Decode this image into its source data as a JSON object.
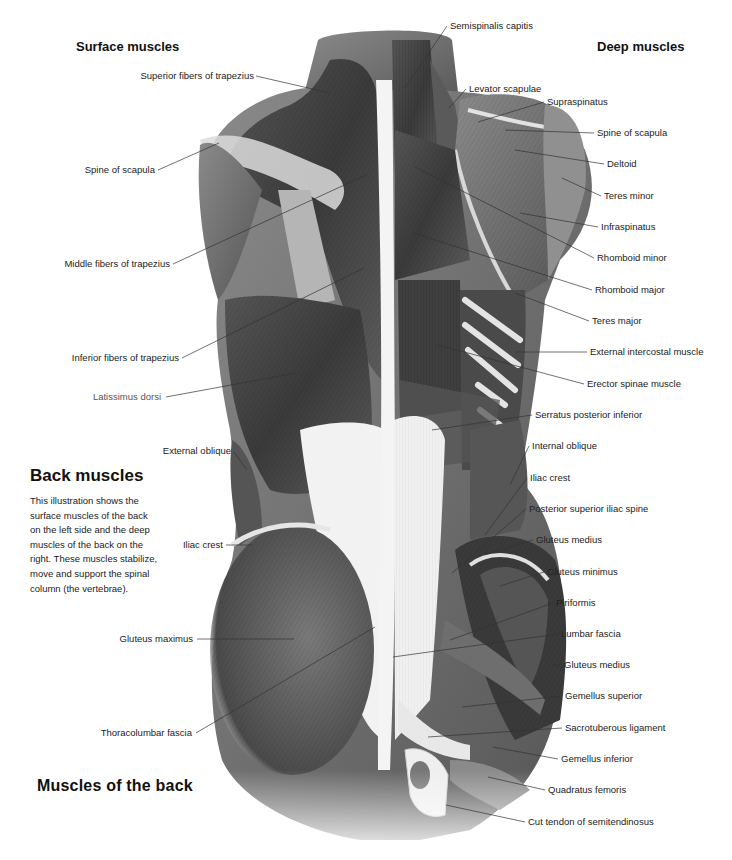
{
  "headings": {
    "surface": "Surface muscles",
    "deep": "Deep muscles"
  },
  "info_panel": {
    "title": "Back muscles",
    "body": "This illustration shows the surface muscles of the back on the left side and the deep muscles of the back on the right. These muscles stabilize, move and support the spinal column (the vertebrae)."
  },
  "caption": "Muscles of the back",
  "labels_left": [
    {
      "text": "Superior fibers of trapezius",
      "x": 254,
      "y": 76,
      "lx1": 256,
      "ly1": 76,
      "lx2": 330,
      "ly2": 93
    },
    {
      "text": "Spine of scapula",
      "x": 155,
      "y": 170,
      "lx1": 158,
      "ly1": 170,
      "lx2": 219,
      "ly2": 143
    },
    {
      "text": "Middle fibers of trapezius",
      "x": 170,
      "y": 264,
      "lx1": 173,
      "ly1": 264,
      "lx2": 366,
      "ly2": 175
    },
    {
      "text": "Inferior fibers of trapezius",
      "x": 179,
      "y": 358,
      "lx1": 182,
      "ly1": 358,
      "lx2": 364,
      "ly2": 268
    },
    {
      "text": "Latissimus dorsi",
      "x": 161,
      "y": 397,
      "lx1": 166,
      "ly1": 397,
      "lx2": 296,
      "ly2": 373,
      "light": true
    },
    {
      "text": "External oblique",
      "x": 231,
      "y": 451,
      "lx1": 234,
      "ly1": 452,
      "lx2": 247,
      "ly2": 470
    },
    {
      "text": "Iliac crest",
      "x": 223,
      "y": 545,
      "lx1": 226,
      "ly1": 545,
      "lx2": 252,
      "ly2": 545
    },
    {
      "text": "Gluteus maximus",
      "x": 193,
      "y": 639,
      "lx1": 197,
      "ly1": 639,
      "lx2": 294,
      "ly2": 639
    },
    {
      "text": "Thoracolumbar fascia",
      "x": 192,
      "y": 733,
      "lx1": 196,
      "ly1": 733,
      "lx2": 375,
      "ly2": 627
    }
  ],
  "labels_right": [
    {
      "text": "Semispinalis capitis",
      "x": 450,
      "y": 26,
      "lx1": 447,
      "ly1": 26,
      "lx2": 405,
      "ly2": 88
    },
    {
      "text": "Levator scapulae",
      "x": 469,
      "y": 89,
      "lx1": 466,
      "ly1": 89,
      "lx2": 449,
      "ly2": 108
    },
    {
      "text": "Supraspinatus",
      "x": 547,
      "y": 102,
      "lx1": 544,
      "ly1": 102,
      "lx2": 478,
      "ly2": 122
    },
    {
      "text": "Spine of scapula",
      "x": 597,
      "y": 133,
      "lx1": 594,
      "ly1": 133,
      "lx2": 505,
      "ly2": 130
    },
    {
      "text": "Deltoid",
      "x": 607,
      "y": 164,
      "lx1": 604,
      "ly1": 164,
      "lx2": 515,
      "ly2": 150
    },
    {
      "text": "Teres minor",
      "x": 604,
      "y": 196,
      "lx1": 601,
      "ly1": 196,
      "lx2": 562,
      "ly2": 178
    },
    {
      "text": "Infraspinatus",
      "x": 601,
      "y": 227,
      "lx1": 598,
      "ly1": 227,
      "lx2": 520,
      "ly2": 213
    },
    {
      "text": "Rhomboid minor",
      "x": 597,
      "y": 258,
      "lx1": 594,
      "ly1": 258,
      "lx2": 415,
      "ly2": 167
    },
    {
      "text": "Rhomboid major",
      "x": 595,
      "y": 290,
      "lx1": 592,
      "ly1": 290,
      "lx2": 413,
      "ly2": 233
    },
    {
      "text": "Teres major",
      "x": 592,
      "y": 321,
      "lx1": 589,
      "ly1": 321,
      "lx2": 515,
      "ly2": 293
    },
    {
      "text": "External intercostal muscle",
      "x": 590,
      "y": 352,
      "lx1": 587,
      "ly1": 352,
      "lx2": 515,
      "ly2": 352
    },
    {
      "text": "Erector spinae muscle",
      "x": 587,
      "y": 384,
      "lx1": 584,
      "ly1": 384,
      "lx2": 438,
      "ly2": 345
    },
    {
      "text": "Serratus posterior inferior",
      "x": 535,
      "y": 415,
      "lx1": 532,
      "ly1": 415,
      "lx2": 432,
      "ly2": 430
    },
    {
      "text": "Internal oblique",
      "x": 532,
      "y": 446,
      "lx1": 529,
      "ly1": 446,
      "lx2": 510,
      "ly2": 485
    },
    {
      "text": "Iliac crest",
      "x": 530,
      "y": 478,
      "lx1": 527,
      "ly1": 478,
      "lx2": 485,
      "ly2": 535
    },
    {
      "text": "Posterior superior iliac spine",
      "x": 529,
      "y": 509,
      "lx1": 526,
      "ly1": 509,
      "lx2": 452,
      "ly2": 573
    },
    {
      "text": "Gluteus medius",
      "x": 536,
      "y": 540,
      "lx1": 533,
      "ly1": 540,
      "lx2": 484,
      "ly2": 555
    },
    {
      "text": "Gluteus minimus",
      "x": 547,
      "y": 572,
      "lx1": 544,
      "ly1": 572,
      "lx2": 500,
      "ly2": 586
    },
    {
      "text": "Piriformis",
      "x": 556,
      "y": 603,
      "lx1": 553,
      "ly1": 603,
      "lx2": 450,
      "ly2": 640
    },
    {
      "text": "Lumbar fascia",
      "x": 561,
      "y": 634,
      "lx1": 558,
      "ly1": 634,
      "lx2": 393,
      "ly2": 657
    },
    {
      "text": "Gluteus medius",
      "x": 564,
      "y": 665,
      "lx1": 561,
      "ly1": 665,
      "lx2": 552,
      "ly2": 665
    },
    {
      "text": "Gemellus superior",
      "x": 565,
      "y": 696,
      "lx1": 562,
      "ly1": 696,
      "lx2": 462,
      "ly2": 707
    },
    {
      "text": "Sacrotuberous ligament",
      "x": 565,
      "y": 728,
      "lx1": 562,
      "ly1": 728,
      "lx2": 428,
      "ly2": 737
    },
    {
      "text": "Gemellus inferior",
      "x": 561,
      "y": 759,
      "lx1": 558,
      "ly1": 759,
      "lx2": 493,
      "ly2": 747
    },
    {
      "text": "Quadratus femoris",
      "x": 548,
      "y": 790,
      "lx1": 545,
      "ly1": 790,
      "lx2": 488,
      "ly2": 777
    },
    {
      "text": "Cut tendon of semitendinosus",
      "x": 528,
      "y": 822,
      "lx1": 525,
      "ly1": 822,
      "lx2": 446,
      "ly2": 805
    }
  ],
  "colors": {
    "muscle_dark": "#3a3a3a",
    "muscle_mid": "#6a6a6a",
    "muscle_light": "#9a9a9a",
    "tendon": "#e9e9e9",
    "leader_line": "#333333",
    "background": "#ffffff"
  }
}
